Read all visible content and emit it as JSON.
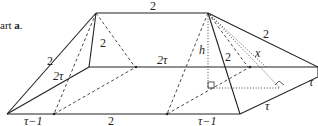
{
  "caption": {
    "prefix": "art ",
    "part": "a",
    "suffix": "."
  },
  "labels": {
    "top_edge": "2",
    "left_slant_top": "2",
    "left_inner": "2",
    "left_slant_bottom": "2τ",
    "back_edge": "2τ",
    "height": "h",
    "right_inner": "2",
    "right_slant": "x",
    "right_top_slant": "2",
    "far_right": "τ",
    "bottom_right_tau": "τ",
    "bottom_left": "τ−1",
    "bottom_mid": "2",
    "bottom_right": "τ−1"
  }
}
